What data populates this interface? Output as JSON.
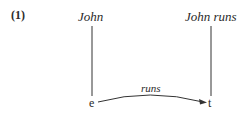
{
  "example_number": "(1)",
  "nodes": {
    "top_left": "John",
    "top_right": "John runs",
    "bottom_left": "e",
    "bottom_right": "t"
  },
  "arrow_label": "runs"
}
